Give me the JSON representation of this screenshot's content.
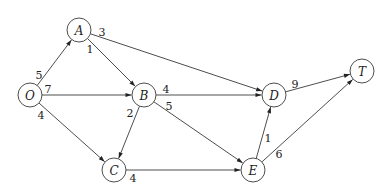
{
  "diagram": {
    "type": "directed-weighted-graph",
    "nodes": [
      {
        "id": "O",
        "label": "O",
        "x": 30,
        "y": 95
      },
      {
        "id": "A",
        "label": "A",
        "x": 79,
        "y": 30
      },
      {
        "id": "B",
        "label": "B",
        "x": 144,
        "y": 95
      },
      {
        "id": "C",
        "label": "C",
        "x": 114,
        "y": 170
      },
      {
        "id": "D",
        "label": "D",
        "x": 274,
        "y": 95
      },
      {
        "id": "E",
        "label": "E",
        "x": 253,
        "y": 170
      },
      {
        "id": "T",
        "label": "T",
        "x": 362,
        "y": 71
      }
    ],
    "edges": [
      {
        "from": "O",
        "to": "A",
        "weight": "5",
        "lx": 39,
        "ly": 75
      },
      {
        "from": "O",
        "to": "B",
        "weight": "7",
        "lx": 48,
        "ly": 89
      },
      {
        "from": "O",
        "to": "C",
        "weight": "4",
        "lx": 41,
        "ly": 115
      },
      {
        "from": "A",
        "to": "B",
        "weight": "1",
        "lx": 90,
        "ly": 49
      },
      {
        "from": "A",
        "to": "D",
        "weight": "3",
        "lx": 102,
        "ly": 32
      },
      {
        "from": "B",
        "to": "D",
        "weight": "4",
        "lx": 166,
        "ly": 89
      },
      {
        "from": "B",
        "to": "C",
        "weight": "2",
        "lx": 130,
        "ly": 113
      },
      {
        "from": "B",
        "to": "E",
        "weight": "5",
        "lx": 169,
        "ly": 106
      },
      {
        "from": "C",
        "to": "E",
        "weight": "4",
        "lx": 133,
        "ly": 178
      },
      {
        "from": "E",
        "to": "D",
        "weight": "1",
        "lx": 268,
        "ly": 138
      },
      {
        "from": "D",
        "to": "T",
        "weight": "9",
        "lx": 295,
        "ly": 84
      },
      {
        "from": "E",
        "to": "T",
        "weight": "6",
        "lx": 279,
        "ly": 154
      }
    ],
    "node_radius": 12,
    "colors": {
      "stroke": "#3a3a3a",
      "text": "#222222",
      "background": "#ffffff"
    }
  }
}
